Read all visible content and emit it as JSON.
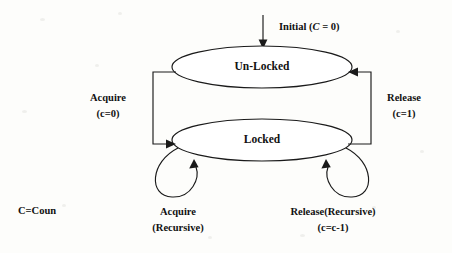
{
  "diagram": {
    "states": [
      {
        "id": "unlocked",
        "label": "Un-Locked"
      },
      {
        "id": "locked",
        "label": "Locked"
      }
    ],
    "initial": {
      "label_prefix": "Initial (",
      "label_var": "C",
      "label_suffix": " = 0)",
      "full_label": "Initial (C = 0)"
    },
    "transitions": [
      {
        "id": "acquire",
        "from": "unlocked",
        "to": "locked",
        "label_line1": "Acquire",
        "label_line2": "(c=0)"
      },
      {
        "id": "release",
        "from": "locked",
        "to": "unlocked",
        "label_line1": "Release",
        "label_line2": "(c=1)"
      },
      {
        "id": "acquire-recursive",
        "from": "locked",
        "to": "locked",
        "label_line1": "Acquire",
        "label_line2": "(Recursive)"
      },
      {
        "id": "release-recursive",
        "from": "locked",
        "to": "locked",
        "label_line1": "Release(Recursive)",
        "label_line2": "(c=c-1)"
      }
    ],
    "legend": {
      "text": "C=Coun"
    },
    "colors": {
      "background": "#fdfdfb",
      "stroke": "#1a1a1a",
      "text": "#111111",
      "state_fill": "#ffffff"
    }
  }
}
